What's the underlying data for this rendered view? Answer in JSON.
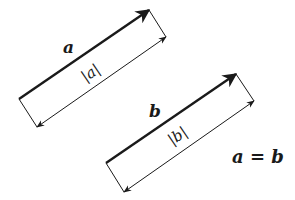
{
  "diagram": {
    "vectors": [
      {
        "label": "a",
        "magnitude_label": "|a|",
        "start": [
          19,
          99
        ],
        "end": [
          149,
          10
        ],
        "offset": [
          17,
          27
        ]
      },
      {
        "label": "b",
        "magnitude_label": "|b|",
        "start": [
          106,
          163
        ],
        "end": [
          236,
          74
        ],
        "offset": [
          18,
          28
        ]
      }
    ],
    "equation": "a = b",
    "colors": {
      "stroke": "#1a1a1a",
      "background": "#ffffff"
    }
  }
}
